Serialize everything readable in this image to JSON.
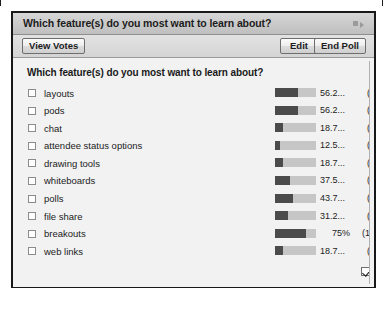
{
  "window": {
    "title": "Which feature(s) do you most want to learn about?",
    "menu_icon": "pod-menu-icon"
  },
  "toolbar": {
    "view_votes_label": "View Votes",
    "edit_label": "Edit",
    "end_poll_label": "End Poll"
  },
  "poll": {
    "question": "Which feature(s) do you most want to learn about?",
    "options": [
      {
        "label": "layouts",
        "percent_text": "56.2...",
        "percent": 56.2,
        "count_text": "(9)",
        "count": 9
      },
      {
        "label": "pods",
        "percent_text": "56.2...",
        "percent": 56.2,
        "count_text": "(9)",
        "count": 9
      },
      {
        "label": "chat",
        "percent_text": "18.7...",
        "percent": 18.7,
        "count_text": "(3)",
        "count": 3
      },
      {
        "label": "attendee status options",
        "percent_text": "12.5...",
        "percent": 12.5,
        "count_text": "(2)",
        "count": 2
      },
      {
        "label": "drawing tools",
        "percent_text": "18.7...",
        "percent": 18.7,
        "count_text": "(3)",
        "count": 3
      },
      {
        "label": "whiteboards",
        "percent_text": "37.5...",
        "percent": 37.5,
        "count_text": "(6)",
        "count": 6
      },
      {
        "label": "polls",
        "percent_text": "43.7...",
        "percent": 43.7,
        "count_text": "(7)",
        "count": 7
      },
      {
        "label": "file share",
        "percent_text": "31.2...",
        "percent": 31.2,
        "count_text": "(5)",
        "count": 5
      },
      {
        "label": "breakouts",
        "percent_text": "75%",
        "percent": 75.0,
        "count_text": "(12)",
        "count": 12
      },
      {
        "label": "web links",
        "percent_text": "18.7...",
        "percent": 18.7,
        "count_text": "(3)",
        "count": 3
      }
    ]
  },
  "footer": {
    "broadcast_label": "Broadcast Results",
    "broadcast_checked": true
  },
  "chart_data": {
    "type": "bar",
    "title": "Which feature(s) do you most want to learn about?",
    "xlabel": "",
    "ylabel": "",
    "categories": [
      "layouts",
      "pods",
      "chat",
      "attendee status options",
      "drawing tools",
      "whiteboards",
      "polls",
      "file share",
      "breakouts",
      "web links"
    ],
    "values": [
      56.2,
      56.2,
      18.7,
      12.5,
      18.7,
      37.5,
      43.7,
      31.2,
      75.0,
      18.7
    ],
    "counts": [
      9,
      9,
      3,
      2,
      3,
      6,
      7,
      5,
      12,
      3
    ],
    "value_unit": "percent",
    "ylim": [
      0,
      100
    ],
    "grid": false,
    "legend": "none",
    "colors": {
      "fill": "#4b4b4b",
      "track": "#c6c6c6"
    }
  }
}
